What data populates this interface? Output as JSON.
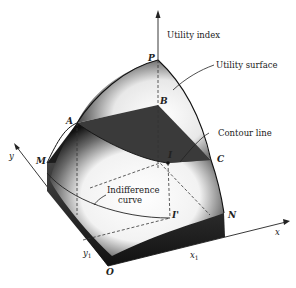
{
  "figure": {
    "type": "3d-utility-surface",
    "colors": {
      "surface_dark": "#1a1a1a",
      "surface_light": "#ffffff",
      "contour_plane": "#3a3a3a",
      "line": "#222222"
    },
    "axes": {
      "vertical": "Utility index",
      "x": "x",
      "y": "y"
    },
    "annotations": {
      "utility_surface": "Utility surface",
      "contour_line": "Contour line",
      "indifference_curve_line1": "Indifference",
      "indifference_curve_line2": "curve"
    },
    "points": {
      "P": "P",
      "A": "A",
      "B": "B",
      "C": "C",
      "I": "I",
      "I_prime": "I'",
      "M": "M",
      "N": "N",
      "O": "O"
    },
    "ticks": {
      "x1": "x",
      "x1_sub": "1",
      "y1": "y",
      "y1_sub": "1"
    }
  }
}
